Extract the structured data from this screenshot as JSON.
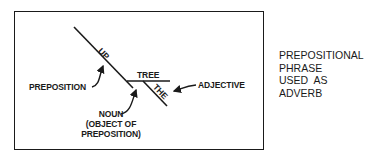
{
  "diagram": {
    "type": "sentence-diagram",
    "words": {
      "preposition_word": "UP",
      "object_word": "TREE",
      "modifier_word": "THE"
    },
    "labels": {
      "preposition": "PREPOSITION",
      "noun_line1": "NOUN",
      "noun_line2": "(OBJECT OF",
      "noun_line3": "PREPOSITION)",
      "adjective": "ADJECTIVE"
    },
    "caption": {
      "line1": "PREPOSITIONAL",
      "line2": "PHRASE",
      "line3": "USED  AS",
      "line4": "ADVERB"
    },
    "colors": {
      "ink": "#1a1a1a",
      "background": "#ffffff"
    }
  }
}
